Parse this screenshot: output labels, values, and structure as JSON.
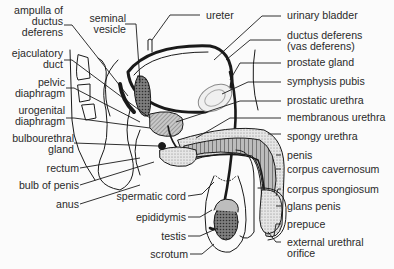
{
  "diagram": {
    "type": "anatomical-illustration",
    "colors": {
      "background": "#fbfbfb",
      "line": "#1a1a1a",
      "text": "#2a2a2a",
      "stipple_light": "#d6d6d6",
      "shade_mid": "#a9a9a9",
      "shade_dark": "#6e6e6e"
    },
    "labels_left": [
      {
        "id": "ampulla",
        "lines": [
          "ampulla of",
          "ductus",
          "deferens"
        ]
      },
      {
        "id": "ejaculatory-duct",
        "lines": [
          "ejaculatory",
          "duct"
        ]
      },
      {
        "id": "pelvic-diaphragm",
        "lines": [
          "pelvic",
          "diaphragm"
        ]
      },
      {
        "id": "urogenital-diaphragm",
        "lines": [
          "urogenital",
          "diaphragm"
        ]
      },
      {
        "id": "bulbourethral-gland",
        "lines": [
          "bulbourethral",
          "gland"
        ]
      },
      {
        "id": "rectum",
        "lines": [
          "rectum"
        ]
      },
      {
        "id": "bulb-of-penis",
        "lines": [
          "bulb of penis"
        ]
      },
      {
        "id": "anus",
        "lines": [
          "anus"
        ]
      }
    ],
    "labels_top": [
      {
        "id": "seminal-vesicle",
        "lines": [
          "seminal",
          "vesicle"
        ]
      },
      {
        "id": "ureter",
        "lines": [
          "ureter"
        ]
      }
    ],
    "labels_bottom_center": [
      {
        "id": "spermatic-cord",
        "lines": [
          "spermatic cord"
        ]
      },
      {
        "id": "epididymis",
        "lines": [
          "epididymis"
        ]
      },
      {
        "id": "testis",
        "lines": [
          "testis"
        ]
      },
      {
        "id": "scrotum",
        "lines": [
          "scrotum"
        ]
      }
    ],
    "labels_right": [
      {
        "id": "urinary-bladder",
        "lines": [
          "urinary bladder"
        ]
      },
      {
        "id": "ductus-deferens",
        "lines": [
          "ductus deferens",
          "(vas deferens)"
        ]
      },
      {
        "id": "prostate-gland",
        "lines": [
          "prostate gland"
        ]
      },
      {
        "id": "symphysis-pubis",
        "lines": [
          "symphysis pubis"
        ]
      },
      {
        "id": "prostatic-urethra",
        "lines": [
          "prostatic urethra"
        ]
      },
      {
        "id": "membranous-urethra",
        "lines": [
          "membranous urethra"
        ]
      },
      {
        "id": "spongy-urethra",
        "lines": [
          "spongy urethra"
        ]
      },
      {
        "id": "penis",
        "lines": [
          "penis"
        ]
      },
      {
        "id": "corpus-cavernosum",
        "lines": [
          "corpus cavernosum"
        ]
      },
      {
        "id": "corpus-spongiosum",
        "lines": [
          "corpus spongiosum"
        ]
      },
      {
        "id": "glans-penis",
        "lines": [
          "glans penis"
        ]
      },
      {
        "id": "prepuce",
        "lines": [
          "prepuce"
        ]
      },
      {
        "id": "external-urethral-orifice",
        "lines": [
          "external urethral",
          "orifice"
        ]
      }
    ]
  }
}
